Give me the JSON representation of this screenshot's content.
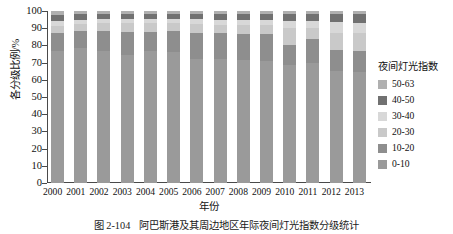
{
  "chart_data": {
    "type": "bar",
    "subtype": "stacked-percentage",
    "title": "",
    "xlabel": "年份",
    "ylabel": "各分级比例/%",
    "ylim": [
      0,
      100
    ],
    "yticks": [
      0,
      10,
      20,
      30,
      40,
      50,
      60,
      70,
      80,
      90,
      100
    ],
    "grid": false,
    "legend_position": "right",
    "legend_title": "夜间灯光指数",
    "categories": [
      "2000",
      "2001",
      "2002",
      "2003",
      "2004",
      "2005",
      "2006",
      "2007",
      "2008",
      "2009",
      "2010",
      "2011",
      "2012",
      "2013"
    ],
    "series": [
      {
        "name": "0-10",
        "color": "#9a9a9a",
        "values": [
          77.0,
          78.5,
          77.0,
          74.5,
          76.5,
          76.0,
          72.0,
          72.0,
          71.5,
          71.0,
          68.5,
          69.5,
          65.0,
          64.5
        ]
      },
      {
        "name": "10-20",
        "color": "#8e8e8e",
        "values": [
          10.0,
          10.0,
          11.5,
          13.5,
          11.5,
          12.5,
          15.0,
          15.0,
          15.0,
          15.5,
          12.0,
          14.0,
          12.5,
          12.5
        ]
      },
      {
        "name": "20-30",
        "color": "#c9c9c9",
        "values": [
          4.5,
          4.0,
          4.5,
          5.0,
          5.0,
          4.5,
          5.5,
          5.0,
          5.5,
          5.5,
          9.5,
          6.5,
          10.0,
          10.0
        ]
      },
      {
        "name": "30-40",
        "color": "#d8d8d8",
        "values": [
          2.5,
          2.5,
          2.5,
          2.5,
          2.5,
          2.5,
          3.0,
          3.0,
          3.0,
          3.0,
          4.5,
          4.0,
          6.0,
          6.0
        ]
      },
      {
        "name": "40-50",
        "color": "#717171",
        "values": [
          3.5,
          3.0,
          3.0,
          3.0,
          3.0,
          3.0,
          3.0,
          3.5,
          3.5,
          3.5,
          4.0,
          4.5,
          5.0,
          5.5
        ]
      },
      {
        "name": "50-63",
        "color": "#b0b0b0",
        "values": [
          2.5,
          2.0,
          1.5,
          1.5,
          1.5,
          1.5,
          1.5,
          1.5,
          1.5,
          1.5,
          1.5,
          1.5,
          1.5,
          1.5
        ]
      }
    ]
  },
  "legend": {
    "title": "夜间灯光指数",
    "items": [
      {
        "label": "50-63",
        "color": "#b0b0b0"
      },
      {
        "label": "40-50",
        "color": "#717171"
      },
      {
        "label": "30-40",
        "color": "#d8d8d8"
      },
      {
        "label": "20-30",
        "color": "#c9c9c9"
      },
      {
        "label": "10-20",
        "color": "#8e8e8e"
      },
      {
        "label": "0-10",
        "color": "#9a9a9a"
      }
    ]
  },
  "axes": {
    "y_title": "各分级比例/%",
    "x_title": "年份",
    "y_ticks": [
      "100",
      "90",
      "80",
      "70",
      "60",
      "50",
      "40",
      "30",
      "20",
      "10",
      "0"
    ],
    "x_ticks": [
      "2000",
      "2001",
      "2002",
      "2003",
      "2004",
      "2005",
      "2006",
      "2007",
      "2008",
      "2009",
      "2010",
      "2011",
      "2012",
      "2013"
    ]
  },
  "caption": {
    "number": "图 2-104",
    "text": "阿巴斯港及其周边地区年际夜间灯光指数分级统计"
  }
}
